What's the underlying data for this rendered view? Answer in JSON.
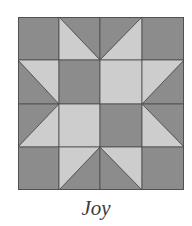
{
  "block": {
    "name": "Joy",
    "grid": {
      "rows": 4,
      "cols": 4
    },
    "colors": {
      "dark": "#8c8c8c",
      "light": "#cdcdcd",
      "seam": "#4a4a4a",
      "caption": "#3a3a3a"
    },
    "cells": [
      [
        "dark",
        "hst-light-bl",
        "hst-light-br",
        "dark"
      ],
      [
        "hst-light-tr",
        "dark",
        "light",
        "hst-light-tl"
      ],
      [
        "hst-light-br",
        "light",
        "dark",
        "hst-light-bl"
      ],
      [
        "dark",
        "hst-light-tl",
        "hst-light-tr",
        "dark"
      ]
    ]
  },
  "caption": {
    "text": "Joy"
  }
}
